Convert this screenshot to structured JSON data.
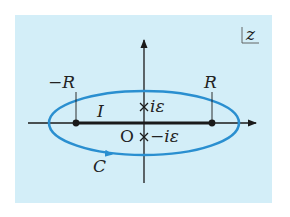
{
  "diagram": {
    "plane_label": "z",
    "labels": {
      "neg_R": "−R",
      "pos_R": "R",
      "interval": "I",
      "origin": "O",
      "pole_upper": "iε",
      "pole_lower": "−iε",
      "contour": "C"
    },
    "colors": {
      "background": "#d3eef8",
      "contour": "#2a8fd0",
      "axis": "#1a1a1a"
    }
  }
}
